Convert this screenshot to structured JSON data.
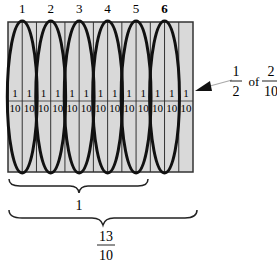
{
  "top_labels": [
    "1",
    "2",
    "3",
    "4",
    "5",
    "6"
  ],
  "tenth_label": {
    "numerator": "1",
    "denominator": "10"
  },
  "tenths_count": 13,
  "annotation": {
    "num1": "1",
    "den1": "2",
    "word": "of",
    "num2": "2",
    "den2": "10"
  },
  "brace_small": {
    "label": "1"
  },
  "brace_large": {
    "numerator": "13",
    "denominator": "10"
  },
  "colors": {
    "fill": "#d9d9d9",
    "stroke": "#222222",
    "ellipse": "#111111"
  }
}
